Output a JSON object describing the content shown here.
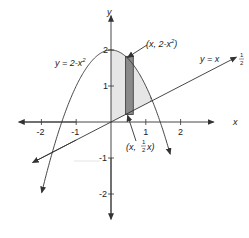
{
  "diagram": {
    "axes": {
      "x_label": "x",
      "y_label": "y",
      "x_ticks": [
        {
          "value": -2,
          "label": "-2"
        },
        {
          "value": -1,
          "label": "-1"
        },
        {
          "value": 1,
          "label": "1"
        },
        {
          "value": 2,
          "label": "2"
        }
      ],
      "y_ticks": [
        {
          "value": 2,
          "label": "2"
        },
        {
          "value": 1,
          "label": "1"
        },
        {
          "value": -1,
          "label": "-1"
        },
        {
          "value": -2,
          "label": "-2"
        }
      ]
    },
    "curves": {
      "parabola": {
        "label_prefix": "y = 2-x",
        "label_exp": "2"
      },
      "line": {
        "label_prefix": "y =  x",
        "label_frac_num": "1",
        "label_frac_den": "2"
      }
    },
    "points": {
      "top": {
        "label_prefix": "(x, 2-x",
        "label_exp": "2",
        "label_suffix": ")"
      },
      "bottom": {
        "label_prefix": "(x, ",
        "label_frac_num": "1",
        "label_frac_den": "2",
        "label_suffix": "x)"
      }
    },
    "colors": {
      "region_fill": "#e6e6e6",
      "slice_fill": "#8a8a8a",
      "stroke": "#333333"
    }
  }
}
